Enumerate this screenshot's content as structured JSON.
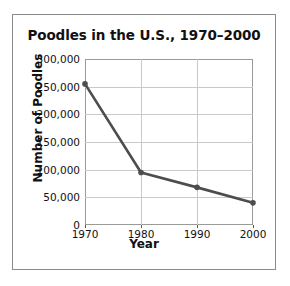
{
  "figure": {
    "title": "Poodles in the U.S., 1970–2000",
    "background_color": "#ffffff",
    "border_color": "#8a8a8a",
    "series_color": "#4d4d4d",
    "grid_color": "#c9c9c9"
  },
  "chart_data": {
    "type": "line",
    "title": "Poodles in the U.S., 1970–2000",
    "xlabel": "Year",
    "ylabel": "Number of Poodles",
    "x": [
      1970,
      1980,
      1990,
      2000
    ],
    "values": [
      255000,
      95000,
      68000,
      40000
    ],
    "xtick_labels": [
      "1970",
      "1980",
      "1990",
      "2000"
    ],
    "ytick_values": [
      0,
      50000,
      100000,
      150000,
      200000,
      250000,
      300000
    ],
    "ytick_labels": [
      "0",
      "50,000",
      "100,000",
      "150,000",
      "200,000",
      "250,000",
      "300,000"
    ],
    "xlim": [
      1970,
      2000
    ],
    "ylim": [
      0,
      300000
    ],
    "grid": true,
    "legend": null,
    "marker": "circle",
    "line_color": "#4d4d4d"
  }
}
